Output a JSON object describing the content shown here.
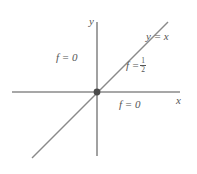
{
  "figure": {
    "kind": "coordinate-plane-diagram",
    "background_color": "#ffffff",
    "line_color": "#8a8a8a",
    "text_color": "#555555",
    "origin_marker_color": "#4a4a4a"
  },
  "axes": {
    "x_label": "x",
    "y_label": "y",
    "x_axis": {
      "x1": 12,
      "y1": 92,
      "x2": 180,
      "y2": 92
    },
    "y_axis": {
      "x1": 97,
      "y1": 22,
      "x2": 97,
      "y2": 156
    },
    "origin": {
      "x": 97,
      "y": 92
    }
  },
  "curve": {
    "label": "y = x",
    "equation_lhs": "y",
    "equation_rel": "=",
    "equation_rhs": "x",
    "x1": 32,
    "y1": 158,
    "x2": 168,
    "y2": 22
  },
  "annotations": {
    "f_zero_upper_left": "f = 0",
    "f_zero_lower_right": "f = 0",
    "f_half_symbol": "f =",
    "f_half_numerator": "1",
    "f_half_denominator": "2"
  },
  "chart_data": {
    "type": "line",
    "title": "",
    "xlabel": "x",
    "ylabel": "y",
    "grid": false,
    "legend": "none",
    "xlim": [
      -1,
      1
    ],
    "ylim": [
      -1,
      1
    ],
    "series": [
      {
        "name": "y = x",
        "x": [
          -1,
          1
        ],
        "values": [
          -1,
          1
        ]
      }
    ],
    "annotations": [
      {
        "text": "y = x",
        "region": "upper-right along line"
      },
      {
        "text": "f = 1/2",
        "region": "on the line y = x"
      },
      {
        "text": "f = 0",
        "region": "second quadrant (off the line)"
      },
      {
        "text": "f = 0",
        "region": "fourth quadrant (off the line)"
      }
    ],
    "markers": [
      {
        "x": 0,
        "y": 0,
        "label": "origin"
      }
    ]
  }
}
